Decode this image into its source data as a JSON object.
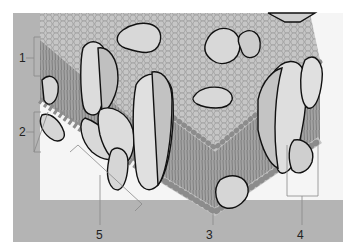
{
  "diagram": {
    "labels": [
      {
        "id": "1",
        "text": "1",
        "x": 19,
        "y": 54
      },
      {
        "id": "2",
        "text": "2",
        "x": 19,
        "y": 126
      },
      {
        "id": "3",
        "text": "3",
        "x": 206,
        "y": 229
      },
      {
        "id": "4",
        "text": "4",
        "x": 297,
        "y": 229
      },
      {
        "id": "5",
        "text": "5",
        "x": 96,
        "y": 229
      }
    ],
    "colors": {
      "frame": "#b4b4b4",
      "background": "#f4f4f4",
      "head": "#c4c4c4",
      "head_edge": "#8c8c8c",
      "tails": "#9a9a9a",
      "protein": "#dadada",
      "protein_shade": "#bdbdbd",
      "outline": "#111111",
      "leader": "#888888"
    }
  }
}
